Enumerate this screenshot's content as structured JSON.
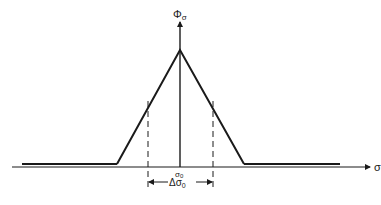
{
  "diagram": {
    "type": "triangular distribution function",
    "labels": {
      "y_axis": "Φ",
      "y_axis_sub": "σ",
      "x_axis": "σ",
      "center_tick": "σ",
      "center_tick_sub": "0",
      "width_label_prefix": "Δσ",
      "width_label_sub": "0"
    },
    "geometry": {
      "axis_y": 167,
      "axis_x_start": 12,
      "axis_x_end": 372,
      "vertical_axis_x": 180,
      "vertical_axis_top": 20,
      "peak": [
        180,
        50
      ],
      "left_foot": [
        117,
        164
      ],
      "right_foot": [
        244,
        164
      ],
      "baseline_left": [
        22,
        117
      ],
      "baseline_right": [
        244,
        340
      ],
      "baseline_y": 164,
      "dashed_left_x": 148,
      "dashed_right_x": 213,
      "dashed_top": 101,
      "dashed_bottom": 190,
      "width_arrow_y": 182
    },
    "colors": {
      "line": "#1a1a1a",
      "background": "#ffffff"
    }
  }
}
